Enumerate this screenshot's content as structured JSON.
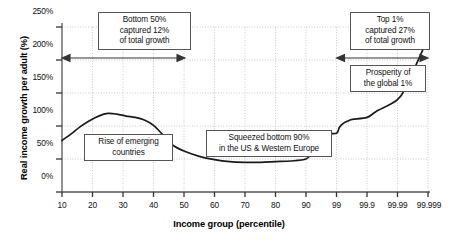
{
  "chart_data": {
    "type": "line",
    "title": "",
    "xlabel": "Income group (percentile)",
    "ylabel": "Real income growth per adult (%)",
    "x_tick_labels": [
      "10",
      "20",
      "30",
      "40",
      "50",
      "60",
      "70",
      "80",
      "90",
      "99",
      "99.9",
      "99.99",
      "99.999"
    ],
    "y_tick_labels": [
      "0%",
      "50%",
      "100%",
      "150%",
      "200%",
      "250%"
    ],
    "y_tick_values": [
      0,
      50,
      100,
      150,
      200,
      250
    ],
    "ylim": [
      0,
      250
    ],
    "grid": true,
    "legend": "none",
    "x_scale": "ordinal-log-percentile",
    "categories": [
      "10",
      "20",
      "30",
      "40",
      "50",
      "60",
      "70",
      "80",
      "90",
      "99",
      "99.9",
      "99.99",
      "99.999"
    ],
    "series": [
      {
        "name": "Real income growth per adult",
        "points": [
          {
            "x": 10,
            "y": 78
          },
          {
            "x": 13,
            "y": 88
          },
          {
            "x": 16,
            "y": 99
          },
          {
            "x": 19,
            "y": 108
          },
          {
            "x": 22,
            "y": 115
          },
          {
            "x": 25,
            "y": 119
          },
          {
            "x": 28,
            "y": 118
          },
          {
            "x": 31,
            "y": 115
          },
          {
            "x": 34,
            "y": 113
          },
          {
            "x": 37,
            "y": 109
          },
          {
            "x": 40,
            "y": 101
          },
          {
            "x": 43,
            "y": 87
          },
          {
            "x": 46,
            "y": 72
          },
          {
            "x": 50,
            "y": 62
          },
          {
            "x": 55,
            "y": 54
          },
          {
            "x": 60,
            "y": 49
          },
          {
            "x": 65,
            "y": 46
          },
          {
            "x": 70,
            "y": 45
          },
          {
            "x": 75,
            "y": 45
          },
          {
            "x": 80,
            "y": 46
          },
          {
            "x": 85,
            "y": 47
          },
          {
            "x": 90,
            "y": 50
          },
          {
            "x": 93,
            "y": 58
          },
          {
            "x": 95,
            "y": 68
          },
          {
            "x": 97,
            "y": 79
          },
          {
            "x": 98,
            "y": 88
          },
          {
            "x": 99,
            "y": 89
          },
          {
            "x": 99.2,
            "y": 98
          },
          {
            "x": 99.4,
            "y": 104
          },
          {
            "x": 99.6,
            "y": 108
          },
          {
            "x": 99.7,
            "y": 110
          },
          {
            "x": 99.9,
            "y": 113
          },
          {
            "x": 99.95,
            "y": 122
          },
          {
            "x": 99.99,
            "y": 140
          },
          {
            "x": 99.995,
            "y": 162
          },
          {
            "x": 99.999,
            "y": 233
          }
        ]
      }
    ],
    "annotations": [
      {
        "id": "bottom50",
        "text": "Bottom 50%\ncaptured 12%\nof total growth",
        "range_start_label": "10",
        "range_end_label": "50",
        "arrow_y_percent": 196
      },
      {
        "id": "top1",
        "text": "Top 1%\ncaptured 27%\nof total growth",
        "range_start_label": "99",
        "range_end_label": "99.999",
        "arrow_y_percent": 196
      },
      {
        "id": "prosperity",
        "text": "Prosperity of\nthe global 1%"
      },
      {
        "id": "rise",
        "text": "Rise of emerging\ncountries"
      },
      {
        "id": "squeezed",
        "text": "Squeezed bottom 90%\nin the US & Western Europe"
      }
    ],
    "colors": {
      "line": "#1a1a1a",
      "axis": "#555555",
      "grid": "#bdbdbd",
      "background": "#ffffff",
      "box_border": "#555555"
    }
  }
}
